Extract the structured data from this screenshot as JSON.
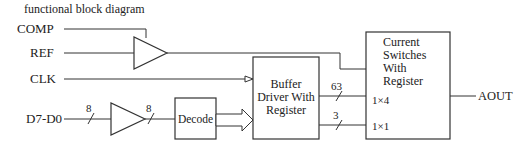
{
  "title": "functional block diagram",
  "inputs": {
    "comp": "COMP",
    "ref": "REF",
    "clk": "CLK",
    "data": "D7-D0"
  },
  "bus_widths": {
    "data_in": "8",
    "data_buffered": "8",
    "upper_bus": "63",
    "lower_bus": "3"
  },
  "blocks": {
    "decode": "Decode",
    "buffer_driver": [
      "Buffer",
      "Driver With",
      "Register"
    ],
    "current_switches": [
      "Current",
      "Switches",
      "With",
      "Register"
    ],
    "switch_port_upper": "1×4",
    "switch_port_lower": "1×1"
  },
  "outputs": {
    "aout": "AOUT"
  }
}
